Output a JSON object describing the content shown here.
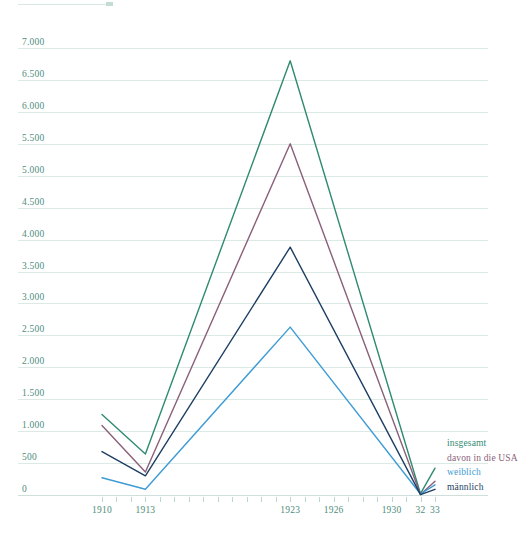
{
  "chart_data": {
    "type": "line",
    "title": "",
    "xlabel": "",
    "ylabel": "",
    "xlim": [
      1909,
      1934
    ],
    "ylim": [
      0,
      7250
    ],
    "grid": true,
    "legend_position": "bottom-right",
    "y_ticks": [
      "0",
      "500",
      "1.000",
      "1.500",
      "2.000",
      "2.500",
      "3.000",
      "3.500",
      "4.000",
      "4.500",
      "5.000",
      "5.500",
      "6.000",
      "6.500",
      "7.000"
    ],
    "y_tick_values": [
      0,
      500,
      1000,
      1500,
      2000,
      2500,
      3000,
      3500,
      4000,
      4500,
      5000,
      5500,
      6000,
      6500,
      7000
    ],
    "x_tick_labels": [
      {
        "value": 1910,
        "label": "1910"
      },
      {
        "value": 1913,
        "label": "1913"
      },
      {
        "value": 1923,
        "label": "1923"
      },
      {
        "value": 1926,
        "label": "1926"
      },
      {
        "value": 1930,
        "label": "1930"
      },
      {
        "value": 1932,
        "label": "32"
      },
      {
        "value": 1933,
        "label": "33"
      }
    ],
    "x_tick_values": [
      1910,
      1911,
      1912,
      1913,
      1914,
      1915,
      1916,
      1917,
      1918,
      1919,
      1920,
      1921,
      1922,
      1923,
      1924,
      1925,
      1926,
      1927,
      1928,
      1929,
      1930,
      1931,
      1932,
      1933
    ],
    "x": [
      1910,
      1913,
      1923,
      1932,
      1933
    ],
    "series": [
      {
        "name": "insgesamt",
        "color": "#2f8a72",
        "values": [
          1260,
          640,
          6800,
          20,
          420
        ]
      },
      {
        "name": "davon in die USA",
        "color": "#8a5f79",
        "values": [
          1090,
          360,
          5500,
          10,
          215
        ]
      },
      {
        "name": "weiblich",
        "color": "#3d9cd4",
        "values": [
          270,
          90,
          2630,
          15,
          160
        ]
      },
      {
        "name": "männlich",
        "color": "#1d3f63",
        "values": [
          680,
          300,
          3880,
          5,
          90
        ]
      }
    ]
  },
  "legend": {
    "items": [
      {
        "label": "insgesamt",
        "color": "#2f8a72"
      },
      {
        "label": "davon in die USA",
        "color": "#8a5f79"
      },
      {
        "label": "weiblich",
        "color": "#3d9cd4"
      },
      {
        "label": "männlich",
        "color": "#1d3f63"
      }
    ]
  }
}
